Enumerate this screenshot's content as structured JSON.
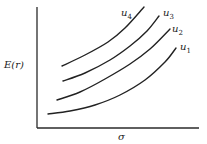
{
  "chart_data": {
    "type": "line",
    "title": "",
    "xlabel": "σ",
    "ylabel": "E(r)",
    "grid": false,
    "legend": "inline labels at curve ends",
    "note": "Indifference curves; qualitative (no tick labels or numeric scale shown)",
    "axes_px": {
      "origin": [
        37,
        128
      ],
      "y_top": [
        37,
        7
      ],
      "x_right": [
        199,
        128
      ]
    },
    "series": [
      {
        "name": "u1",
        "label_main": "u",
        "label_sub": "1",
        "points_px": [
          [
            48,
            114
          ],
          [
            70,
            111
          ],
          [
            95,
            105
          ],
          [
            120,
            95
          ],
          [
            145,
            80
          ],
          [
            165,
            62
          ],
          [
            176,
            48
          ]
        ],
        "label_pos": [
          180,
          50
        ]
      },
      {
        "name": "u2",
        "label_main": "u",
        "label_sub": "2",
        "points_px": [
          [
            57,
            100
          ],
          [
            80,
            92
          ],
          [
            105,
            79
          ],
          [
            130,
            64
          ],
          [
            150,
            49
          ],
          [
            170,
            29
          ]
        ],
        "label_pos": [
          172,
          32
        ]
      },
      {
        "name": "u3",
        "label_main": "u",
        "label_sub": "3",
        "points_px": [
          [
            63,
            81
          ],
          [
            85,
            73
          ],
          [
            110,
            60
          ],
          [
            130,
            46
          ],
          [
            147,
            31
          ],
          [
            159,
            16
          ]
        ],
        "label_pos": [
          163,
          16
        ]
      },
      {
        "name": "u4",
        "label_main": "u",
        "label_sub": "4",
        "points_px": [
          [
            62,
            66
          ],
          [
            85,
            55
          ],
          [
            108,
            42
          ],
          [
            125,
            28
          ],
          [
            144,
            7
          ]
        ],
        "label_pos": [
          121,
          16
        ]
      }
    ]
  }
}
